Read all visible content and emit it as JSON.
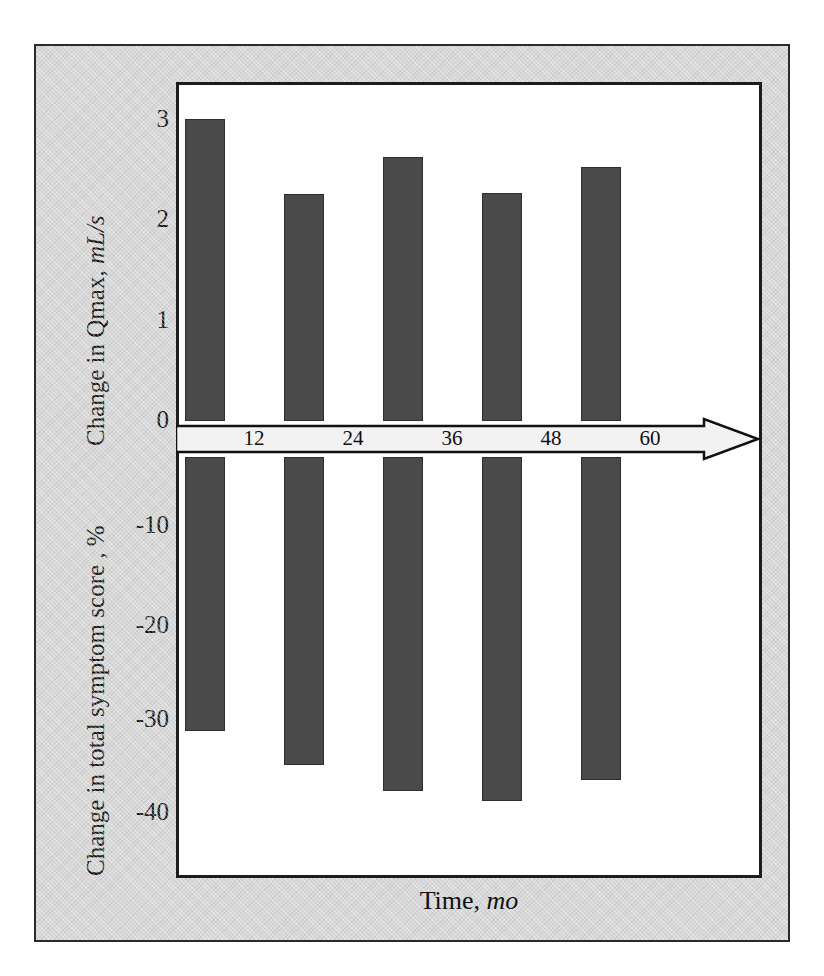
{
  "chart_data": {
    "type": "bar",
    "title": "",
    "xlabel": "Time, mo",
    "xlabel_plain": "Time,",
    "xlabel_italic": "mo",
    "categories": [
      "12",
      "24",
      "36",
      "48",
      "60"
    ],
    "x": [
      12,
      24,
      36,
      48,
      60
    ],
    "grid": false,
    "legend": "none",
    "series": [
      {
        "name": "Change in Qmax, mL/s",
        "axis": "upper",
        "direction": "up",
        "values": [
          3.02,
          2.27,
          2.64,
          2.28,
          2.54
        ],
        "ylabel": "Change in Qmax, mL/s",
        "ylabel_plain": "Change in Qmax,",
        "ylabel_italic": "mL/s",
        "ticks": [
          "0",
          "1",
          "2",
          "3"
        ],
        "tick_values": [
          0,
          1,
          2,
          3
        ],
        "ylim": [
          0,
          3.35
        ]
      },
      {
        "name": "Change in total symptom score , %",
        "axis": "lower",
        "direction": "down",
        "values": [
          -32.5,
          -36.0,
          -38.7,
          -39.8,
          -37.6
        ],
        "ylabel": "Change in total symptom score , %",
        "ticks": [
          "-10",
          "-20",
          "-30",
          "-40"
        ],
        "tick_values": [
          -10,
          -20,
          -30,
          -40
        ],
        "ylim": [
          -42.5,
          0
        ]
      }
    ],
    "colors": {
      "bar_fill": "#4a4a4a",
      "bar_stroke": "#2e2e2e",
      "panel_background": "#ffffff",
      "mount_background": "#d8d8d8",
      "axis_line": "#111111",
      "arrow_fill": "#f2f2f2"
    },
    "axis_arrow": {
      "name": "time-axis-arrow",
      "direction": "right",
      "style": "block-arrow-outlined"
    }
  }
}
